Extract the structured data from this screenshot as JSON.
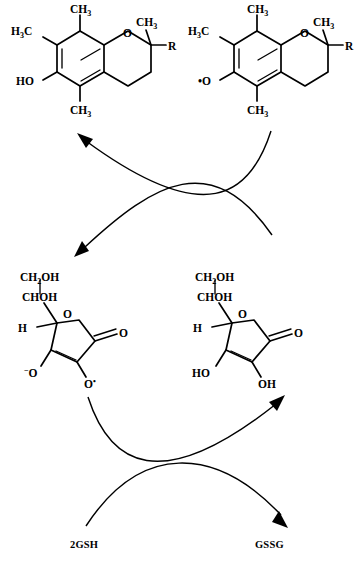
{
  "figure": {
    "type": "chemical-reaction-scheme",
    "background_color": "#ffffff",
    "line_color": "#000000"
  },
  "structures": {
    "top_left": {
      "name": "alpha-tocopherol",
      "role": "reduced vitamin E",
      "position": "top-left",
      "labels": {
        "methyl_top": "CH",
        "methyl_top_sub": "3",
        "methyl_left": "H",
        "methyl_left_sub": "3",
        "methyl_left_tail": "C",
        "methyl_bottom": "CH",
        "methyl_bottom_sub": "3",
        "methyl_right": "CH",
        "methyl_right_sub": "3",
        "ring_oxygen": "O",
        "side_chain": "R",
        "phenol": "HO"
      }
    },
    "top_right": {
      "name": "alpha-tocopheroxyl radical",
      "role": "oxidized vitamin E radical",
      "position": "top-right",
      "labels": {
        "methyl_top": "CH",
        "methyl_top_sub": "3",
        "methyl_left": "H",
        "methyl_left_sub": "3",
        "methyl_left_tail": "C",
        "methyl_bottom": "CH",
        "methyl_bottom_sub": "3",
        "methyl_right": "CH",
        "methyl_right_sub": "3",
        "ring_oxygen": "O",
        "side_chain": "R",
        "phenol_radical": "•O"
      }
    },
    "bottom_left": {
      "name": "ascorbyl radical",
      "role": "monodehydroascorbate radical",
      "position": "bottom-left",
      "labels": {
        "hydroxymethyl": "CH",
        "hydroxymethyl_sub": "2",
        "hydroxymethyl_tail": "OH",
        "carbinol": "CHOH",
        "ring_oxygen": "O",
        "carbonyl_oxygen": "O",
        "hydrogen": "H",
        "enolate_left_sup": "−",
        "enolate_left": "O",
        "enolate_right": "O",
        "enolate_right_radical": "•"
      }
    },
    "bottom_right": {
      "name": "ascorbate",
      "role": "reduced vitamin C",
      "position": "bottom-right",
      "labels": {
        "hydroxymethyl": "CH",
        "hydroxymethyl_sub": "2",
        "hydroxymethyl_tail": "OH",
        "carbinol": "CHOH",
        "ring_oxygen": "O",
        "carbonyl_oxygen": "O",
        "hydrogen": "H",
        "hydroxyl_left": "HO",
        "hydroxyl_right": "OH"
      }
    }
  },
  "cofactors": {
    "reduced_glutathione": "2GSH",
    "oxidized_glutathione": "GSSG"
  },
  "arrows": {
    "upper_cycle": {
      "left_arrow_direction": "up-left",
      "right_arrow_direction": "down-left",
      "description": "crossing curved arrows between tocopherol pair and ascorbate pair"
    },
    "lower_cycle": {
      "left_arrow_direction": "up-right",
      "right_arrow_direction": "down-right",
      "description": "crossing curved arrows between glutathione pair and ascorbate pair"
    }
  },
  "caption": {
    "cut_off_line": "the upper portion of a cut-off caption line"
  }
}
